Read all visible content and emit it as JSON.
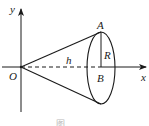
{
  "diagram": {
    "type": "cone-on-axes",
    "colors": {
      "stroke": "#1a1a1a",
      "background": "#ffffff"
    },
    "labels": {
      "y_axis": "y",
      "x_axis": "x",
      "origin": "O",
      "top_point": "A",
      "center_point": "B",
      "radius": "R",
      "height": "h"
    },
    "caption": "图"
  }
}
